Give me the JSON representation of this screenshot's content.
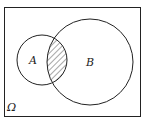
{
  "diagram": {
    "type": "venn",
    "universe_label": "Ω",
    "sets": [
      {
        "label": "A"
      },
      {
        "label": "B"
      }
    ],
    "shaded_region": "A ∩ B",
    "colors": {
      "stroke": "#222222",
      "background": "#ffffff",
      "hatch": "#222222"
    }
  }
}
